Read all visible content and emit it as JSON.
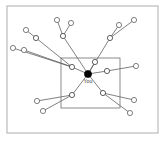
{
  "figure": {
    "background_color": "#ffffff",
    "frame": {
      "name": "outer-frame",
      "x": 7,
      "y": 6,
      "width": 151,
      "height": 127,
      "stroke_color": "#b4b4b4"
    },
    "boundary": {
      "name": "inner-boundary-rect",
      "label": "",
      "x": 61,
      "y": 58,
      "width": 59,
      "height": 50,
      "stroke_color": "#6e6e6e"
    }
  },
  "chart_data": {
    "type": "scatter",
    "xlabel": "",
    "ylabel": "",
    "grid": false,
    "legend": "none",
    "xlim": [
      0,
      168
    ],
    "ylim": [
      0,
      144
    ],
    "ego": {
      "id": "you",
      "label": "You",
      "x": 88,
      "y": 74,
      "radius": 3.6,
      "fill": "#000000",
      "style": "filled"
    },
    "nodes": [
      {
        "id": "h1",
        "label": "",
        "x": 72,
        "y": 67,
        "radius": 2.6,
        "tier": "hub",
        "fill": "#ffffff"
      },
      {
        "id": "h2",
        "label": "",
        "x": 95,
        "y": 62,
        "radius": 2.6,
        "tier": "hub",
        "fill": "#ffffff"
      },
      {
        "id": "h3",
        "label": "",
        "x": 107,
        "y": 71,
        "radius": 2.6,
        "tier": "hub",
        "fill": "#ffffff"
      },
      {
        "id": "h4",
        "label": "",
        "x": 103,
        "y": 93,
        "radius": 2.6,
        "tier": "hub",
        "fill": "#ffffff"
      },
      {
        "id": "h5",
        "label": "",
        "x": 72,
        "y": 95,
        "radius": 2.6,
        "tier": "hub",
        "fill": "#ffffff"
      },
      {
        "id": "h6",
        "label": "",
        "x": 63,
        "y": 36,
        "radius": 2.6,
        "tier": "hub",
        "fill": "#ffffff"
      },
      {
        "id": "h7",
        "label": "",
        "x": 110,
        "y": 38,
        "radius": 2.6,
        "tier": "hub",
        "fill": "#ffffff"
      },
      {
        "id": "h8",
        "label": "",
        "x": 36,
        "y": 38,
        "radius": 2.6,
        "tier": "hub",
        "fill": "#ffffff"
      },
      {
        "id": "l1",
        "label": "",
        "x": 26,
        "y": 30,
        "radius": 2.6,
        "tier": "leaf",
        "fill": "#ffffff"
      },
      {
        "id": "l2",
        "label": "",
        "x": 13,
        "y": 48,
        "radius": 2.6,
        "tier": "leaf",
        "fill": "#ffffff"
      },
      {
        "id": "l3",
        "label": "",
        "x": 24,
        "y": 50,
        "radius": 2.6,
        "tier": "leaf",
        "fill": "#ffffff"
      },
      {
        "id": "l4",
        "label": "",
        "x": 57,
        "y": 20,
        "radius": 2.6,
        "tier": "leaf",
        "fill": "#ffffff"
      },
      {
        "id": "l5",
        "label": "",
        "x": 71,
        "y": 23,
        "radius": 2.6,
        "tier": "leaf",
        "fill": "#ffffff"
      },
      {
        "id": "l6",
        "label": "",
        "x": 119,
        "y": 25,
        "radius": 2.6,
        "tier": "leaf",
        "fill": "#ffffff"
      },
      {
        "id": "l7",
        "label": "",
        "x": 134,
        "y": 20,
        "radius": 2.6,
        "tier": "leaf",
        "fill": "#ffffff"
      },
      {
        "id": "l8",
        "label": "",
        "x": 136,
        "y": 66,
        "radius": 2.6,
        "tier": "leaf",
        "fill": "#ffffff"
      },
      {
        "id": "l9",
        "label": "",
        "x": 134,
        "y": 100,
        "radius": 2.6,
        "tier": "leaf",
        "fill": "#ffffff"
      },
      {
        "id": "l10",
        "label": "",
        "x": 130,
        "y": 113,
        "radius": 2.6,
        "tier": "leaf",
        "fill": "#ffffff"
      },
      {
        "id": "l11",
        "label": "",
        "x": 37,
        "y": 101,
        "radius": 2.6,
        "tier": "leaf",
        "fill": "#ffffff"
      },
      {
        "id": "l12",
        "label": "",
        "x": 43,
        "y": 111,
        "radius": 2.6,
        "tier": "leaf",
        "fill": "#ffffff"
      }
    ],
    "edges": [
      {
        "source": "you",
        "target": "h1"
      },
      {
        "source": "you",
        "target": "h2"
      },
      {
        "source": "you",
        "target": "h3"
      },
      {
        "source": "you",
        "target": "h4"
      },
      {
        "source": "you",
        "target": "h5"
      },
      {
        "source": "you",
        "target": "h6"
      },
      {
        "source": "you",
        "target": "h7"
      },
      {
        "source": "h1",
        "target": "h8"
      },
      {
        "source": "h1",
        "target": "l2"
      },
      {
        "source": "h1",
        "target": "l3"
      },
      {
        "source": "h8",
        "target": "l1"
      },
      {
        "source": "h6",
        "target": "l4"
      },
      {
        "source": "h6",
        "target": "l5"
      },
      {
        "source": "h7",
        "target": "l6"
      },
      {
        "source": "h7",
        "target": "l7"
      },
      {
        "source": "h3",
        "target": "l8"
      },
      {
        "source": "h4",
        "target": "l9"
      },
      {
        "source": "h4",
        "target": "l10"
      },
      {
        "source": "h5",
        "target": "l11"
      },
      {
        "source": "h5",
        "target": "l12"
      }
    ]
  }
}
